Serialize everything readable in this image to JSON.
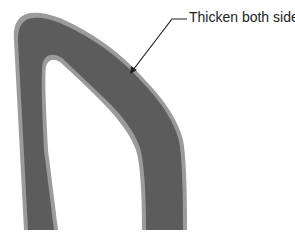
{
  "diagram": {
    "title": "",
    "annotation": {
      "label": "Thicken both sides",
      "arrow_target": "outer edge of curved band"
    },
    "shape": {
      "description": "Inverted-U shaped curved band (dark gray core with light gray thickened border on both sides)",
      "core_color": "#5a5a5a",
      "thickened_color": "#9a9a9a",
      "background_color": "#ffffff"
    }
  }
}
